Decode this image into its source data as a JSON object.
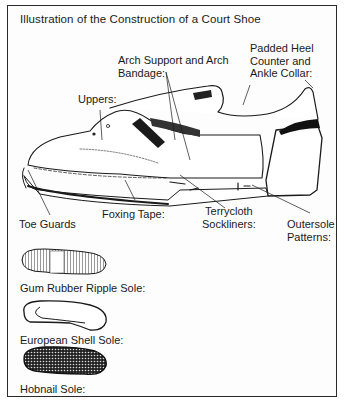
{
  "title": "Illustration of the Construction of a Court Shoe",
  "labels": {
    "arch_support": {
      "line1": "Arch Support and Arch",
      "line2": "Bandage:"
    },
    "padded_heel": {
      "line1": "Padded Heel",
      "line2": "Counter and",
      "line3": "Ankle Collar:"
    },
    "uppers": "Uppers:",
    "toe_guards": "Toe Guards",
    "foxing_tape": "Foxing Tape:",
    "terrycloth": {
      "line1": "Terrycloth",
      "line2": "Sockliners:"
    },
    "outersole": {
      "line1": "Outersole",
      "line2": "Patterns:"
    }
  },
  "soles": [
    {
      "label": "Gum Rubber Ripple Sole:",
      "pattern": "ripple"
    },
    {
      "label": "European Shell Sole:",
      "pattern": "shell"
    },
    {
      "label": "Hobnail Sole:",
      "pattern": "hobnail"
    }
  ],
  "colors": {
    "ink": "#1a1a1a",
    "paper": "#fdfdfd",
    "border": "#2a2a2a"
  }
}
